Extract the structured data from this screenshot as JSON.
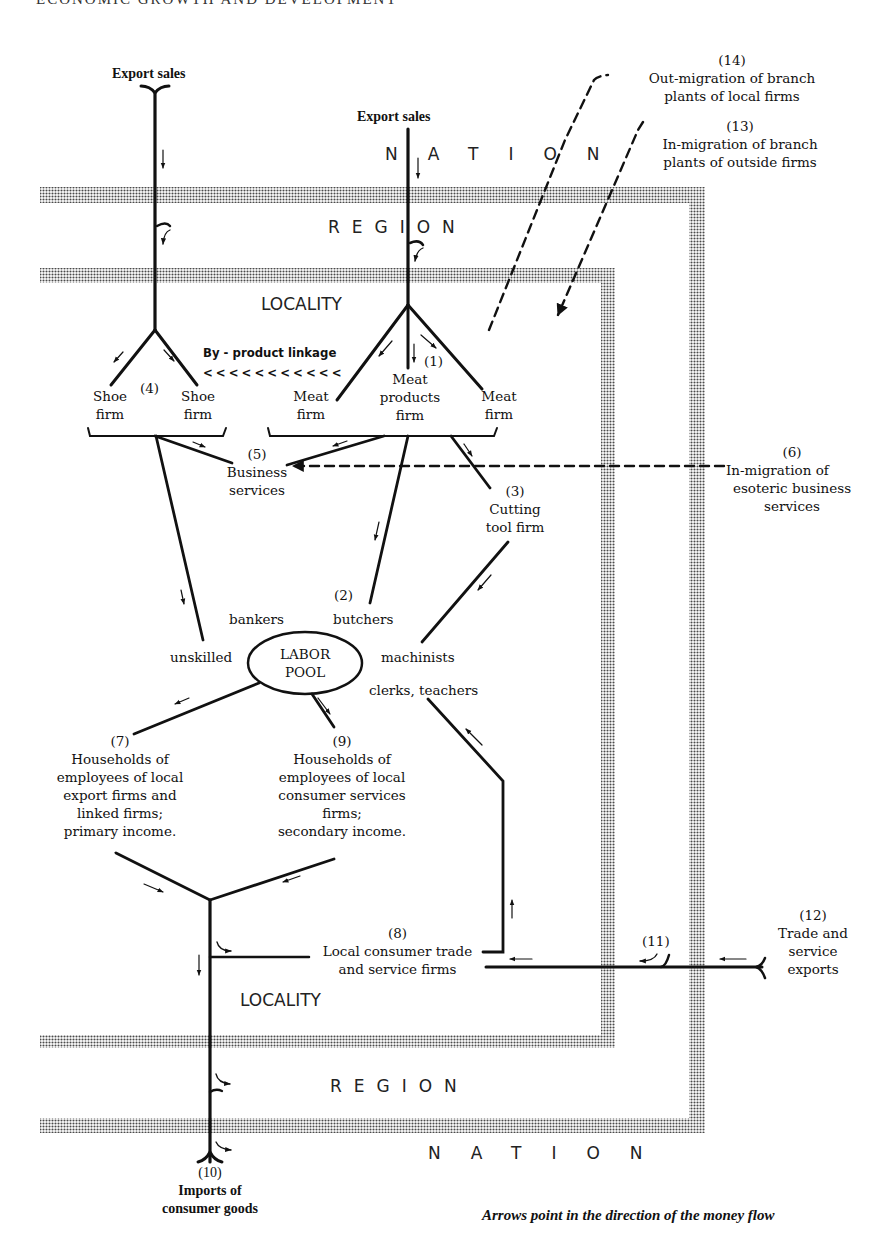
{
  "page": {
    "header": "ECONOMIC GROWTH AND DEVELOPMENT"
  },
  "zones": {
    "nation_top": "NATION",
    "region_top": "REGION",
    "locality_top": "LOCALITY",
    "locality_bottom": "LOCALITY",
    "region_bottom": "REGION",
    "nation_bottom": "NATION"
  },
  "nodes": {
    "export_sales_left": "Export sales",
    "export_sales_center": "Export sales",
    "n1": {
      "num": "(1)",
      "line1": "Meat",
      "line2": "products",
      "line3": "firm"
    },
    "meat_firm_left": {
      "line1": "Meat",
      "line2": "firm"
    },
    "meat_firm_right": {
      "line1": "Meat",
      "line2": "firm"
    },
    "n2": {
      "num": "(2)"
    },
    "n3": {
      "num": "(3)",
      "line1": "Cutting",
      "line2": "tool firm"
    },
    "n4": {
      "num": "(4)"
    },
    "shoe_firm_left": {
      "line1": "Shoe",
      "line2": "firm"
    },
    "shoe_firm_right": {
      "line1": "Shoe",
      "line2": "firm"
    },
    "n5": {
      "num": "(5)",
      "line1": "Business",
      "line2": "services"
    },
    "n6": {
      "num": "(6)",
      "line1": "In-migration of",
      "line2": "esoteric business",
      "line3": "services"
    },
    "n7": {
      "num": "(7)",
      "line1": "Households of",
      "line2": "employees of local",
      "line3": "export firms and",
      "line4": "linked firms;",
      "line5": "primary income."
    },
    "n8": {
      "num": "(8)",
      "line1": "Local consumer trade",
      "line2": "and service firms"
    },
    "n9": {
      "num": "(9)",
      "line1": "Households of",
      "line2": "employees of local",
      "line3": "consumer services",
      "line4": "firms;",
      "line5": "secondary income."
    },
    "n10": {
      "num": "(10)",
      "line1": "Imports of",
      "line2": "consumer goods"
    },
    "n11": {
      "num": "(11)"
    },
    "n12": {
      "num": "(12)",
      "line1": "Trade and",
      "line2": "service",
      "line3": "exports"
    },
    "n13": {
      "num": "(13)",
      "line1": "In-migration of branch",
      "line2": "plants of outside firms"
    },
    "n14": {
      "num": "(14)",
      "line1": "Out-migration of branch",
      "line2": "plants of local firms"
    },
    "byproduct": {
      "label": "By - product linkage",
      "arrows": "< < < < < < < < < < <"
    },
    "labor_pool": {
      "line1": "LABOR",
      "line2": "POOL"
    },
    "labor_types": {
      "bankers": "bankers",
      "butchers": "butchers",
      "unskilled": "unskilled",
      "machinists": "machinists",
      "clerks_teachers": "clerks, teachers"
    }
  },
  "caption": "Arrows point in the direction of the money flow",
  "colors": {
    "ink": "#111111",
    "band_dot": "#555555",
    "paper": "#ffffff"
  }
}
